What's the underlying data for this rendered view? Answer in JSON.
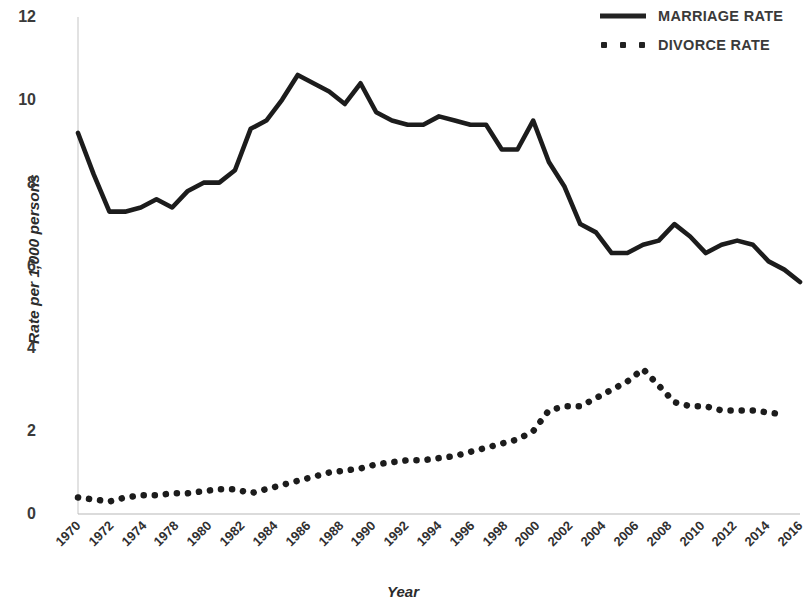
{
  "chart_data": {
    "type": "line",
    "title": "",
    "xlabel": "Year",
    "ylabel": "Rate per 1,000 persons",
    "xlim": [
      1970,
      2016
    ],
    "ylim": [
      0,
      12
    ],
    "yticks": [
      0,
      2,
      4,
      6,
      8,
      10,
      12
    ],
    "xtick_labels": [
      "1970",
      "1972",
      "1974",
      "1978",
      "1980",
      "1982",
      "1984",
      "1986",
      "1988",
      "1990",
      "1992",
      "1994",
      "1996",
      "1998",
      "2000",
      "2002",
      "2004",
      "2006",
      "2008",
      "2010",
      "2012",
      "2014",
      "2016"
    ],
    "grid": false,
    "legend_position": "top-right",
    "x": [
      1970,
      1971,
      1972,
      1973,
      1974,
      1975,
      1976,
      1977,
      1978,
      1979,
      1980,
      1981,
      1982,
      1983,
      1984,
      1985,
      1986,
      1987,
      1988,
      1989,
      1990,
      1991,
      1992,
      1993,
      1994,
      1995,
      1996,
      1997,
      1998,
      1999,
      2000,
      2001,
      2002,
      2003,
      2004,
      2005,
      2006,
      2007,
      2008,
      2009,
      2010,
      2011,
      2012,
      2013,
      2014,
      2015,
      2016
    ],
    "series": [
      {
        "name": "MARRIAGE RATE",
        "style": "solid",
        "color": "#1c1c1c",
        "values": [
          9.2,
          8.2,
          7.3,
          7.3,
          7.4,
          7.6,
          7.4,
          7.8,
          8.0,
          8.0,
          8.3,
          9.3,
          9.5,
          10.0,
          10.6,
          10.4,
          10.2,
          9.9,
          10.4,
          9.7,
          9.5,
          9.4,
          9.4,
          9.6,
          9.5,
          9.4,
          9.4,
          8.8,
          8.8,
          9.5,
          8.5,
          7.9,
          7.0,
          6.8,
          6.3,
          6.3,
          6.5,
          6.6,
          7.0,
          6.7,
          6.3,
          6.5,
          6.6,
          6.5,
          6.1,
          5.9,
          5.6
        ]
      },
      {
        "name": "DIVORCE RATE",
        "style": "dotted",
        "color": "#1c1c1c",
        "values": [
          0.4,
          0.35,
          0.3,
          0.4,
          0.45,
          0.45,
          0.5,
          0.5,
          0.55,
          0.6,
          0.6,
          0.5,
          0.6,
          0.7,
          0.8,
          0.9,
          1.0,
          1.05,
          1.1,
          1.2,
          1.25,
          1.3,
          1.3,
          1.35,
          1.4,
          1.5,
          1.6,
          1.7,
          1.8,
          2.0,
          2.5,
          2.6,
          2.6,
          2.8,
          3.0,
          3.2,
          3.5,
          3.1,
          2.7,
          2.6,
          2.6,
          2.5,
          2.5,
          2.5,
          2.45,
          2.4,
          null
        ]
      }
    ]
  },
  "legend": {
    "items": [
      {
        "label": "MARRIAGE RATE",
        "style": "solid"
      },
      {
        "label": "DIVORCE RATE",
        "style": "dotted"
      }
    ]
  }
}
